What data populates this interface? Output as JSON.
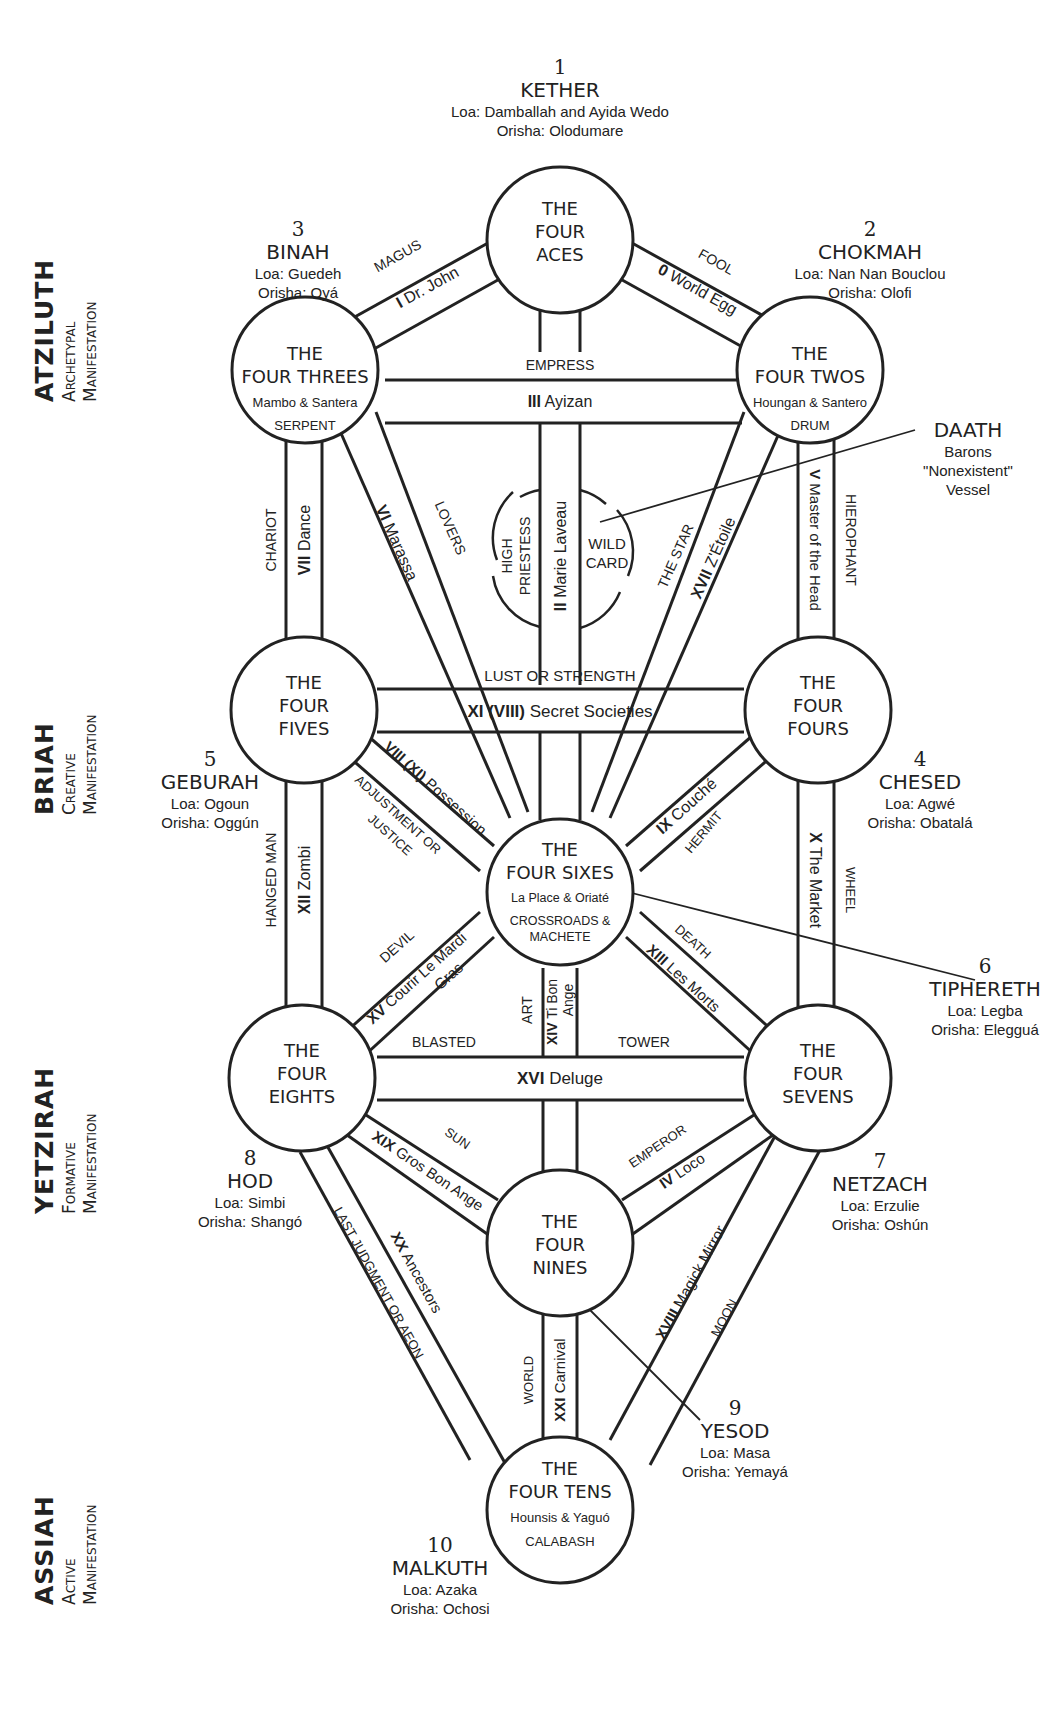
{
  "diagram": {
    "worlds": [
      {
        "name": "ATZILUTH",
        "line1": "Archetypal",
        "line2": "Manifestation"
      },
      {
        "name": "BRIAH",
        "line1": "Creative",
        "line2": "Manifestation"
      },
      {
        "name": "YETZIRAH",
        "line1": "Formative",
        "line2": "Manifestation"
      },
      {
        "name": "ASSIAH",
        "line1": "Active",
        "line2": "Manifestation"
      }
    ],
    "sephiroth": [
      {
        "number": "1",
        "name": "KETHER",
        "loa": "Loa: Damballah and Ayida Wedo",
        "orisha": "Orisha: Olodumare"
      },
      {
        "number": "2",
        "name": "CHOKMAH",
        "loa": "Loa: Nan Nan Bouclou",
        "orisha": "Orisha: Olofi"
      },
      {
        "number": "3",
        "name": "BINAH",
        "loa": "Loa: Guedeh",
        "orisha": "Orisha: Oyá"
      },
      {
        "number": "4",
        "name": "CHESED",
        "loa": "Loa: Agwé",
        "orisha": "Orisha: Obatalá"
      },
      {
        "number": "5",
        "name": "GEBURAH",
        "loa": "Loa: Ogoun",
        "orisha": "Orisha: Oggún"
      },
      {
        "number": "6",
        "name": "TIPHERETH",
        "loa": "Loa: Legba",
        "orisha": "Orisha: Elegguá"
      },
      {
        "number": "7",
        "name": "NETZACH",
        "loa": "Loa: Erzulie",
        "orisha": "Orisha: Oshún"
      },
      {
        "number": "8",
        "name": "HOD",
        "loa": "Loa: Simbi",
        "orisha": "Orisha: Shangó"
      },
      {
        "number": "9",
        "name": "YESOD",
        "loa": "Loa: Masa",
        "orisha": "Orisha: Yemayá"
      },
      {
        "number": "10",
        "name": "MALKUTH",
        "loa": "Loa: Azaka",
        "orisha": "Orisha: Ochosi"
      }
    ],
    "daath": {
      "name": "DAATH",
      "line1": "Barons",
      "line2": "\"Nonexistent\"",
      "line3": "Vessel"
    },
    "circles": {
      "aces": {
        "l1": "THE",
        "l2": "FOUR",
        "l3": "ACES"
      },
      "twos": {
        "l1": "THE",
        "l2": "FOUR TWOS",
        "sub": "Houngan & Santero",
        "symbol": "DRUM"
      },
      "threes": {
        "l1": "THE",
        "l2": "FOUR THREES",
        "sub": "Mambo & Santera",
        "symbol": "SERPENT"
      },
      "fours": {
        "l1": "THE",
        "l2": "FOUR",
        "l3": "FOURS"
      },
      "fives": {
        "l1": "THE",
        "l2": "FOUR",
        "l3": "FIVES"
      },
      "sixes": {
        "l1": "THE",
        "l2": "FOUR SIXES",
        "sub": "La Place & Oriaté",
        "symbol1": "CROSSROADS &",
        "symbol2": "MACHETE"
      },
      "sevens": {
        "l1": "THE",
        "l2": "FOUR",
        "l3": "SEVENS"
      },
      "eights": {
        "l1": "THE",
        "l2": "FOUR",
        "l3": "EIGHTS"
      },
      "nines": {
        "l1": "THE",
        "l2": "FOUR",
        "l3": "NINES"
      },
      "tens": {
        "l1": "THE",
        "l2": "FOUR TENS",
        "sub": "Hounsis & Yaguó",
        "symbol": "CALABASH"
      }
    },
    "wild_card": {
      "line1": "WILD",
      "line2": "CARD"
    },
    "paths": {
      "fool": {
        "trump": "FOOL",
        "num": "0",
        "name": "World Egg"
      },
      "magus": {
        "trump": "MAGUS",
        "num": "I",
        "name": "Dr. John"
      },
      "priestess": {
        "trump": "HIGH PRIESTESS",
        "t1": "HIGH",
        "t2": "PRIESTESS",
        "num": "II",
        "name": "Marie Laveau"
      },
      "empress": {
        "trump": "EMPRESS",
        "num": "III",
        "name": "Ayizan"
      },
      "emperor": {
        "trump": "EMPEROR",
        "num": "IV",
        "name": "Loco"
      },
      "hierophant": {
        "trump": "HIEROPHANT",
        "num": "V",
        "name": "Master of the Head"
      },
      "lovers": {
        "trump": "LOVERS",
        "num": "VI",
        "name": "Marassa"
      },
      "chariot": {
        "trump": "CHARIOT",
        "num": "VII",
        "name": "Dance"
      },
      "adjustment": {
        "trump": "ADJUSTMENT OR",
        "trump2": "JUSTICE",
        "num": "VIII (XI)",
        "name": "Possession"
      },
      "hermit": {
        "trump": "HERMIT",
        "num": "IX",
        "name": "Couché"
      },
      "wheel": {
        "trump": "WHEEL",
        "num": "X",
        "name": "The Market"
      },
      "lust": {
        "trump": "LUST OR STRENGTH",
        "num": "XI (VIII)",
        "name": "Secret Societies"
      },
      "hanged": {
        "trump": "HANGED MAN",
        "num": "XII",
        "name": "Zombi"
      },
      "death": {
        "trump": "DEATH",
        "num": "XIII",
        "name": "Les Morts"
      },
      "art": {
        "trump": "ART",
        "num": "XIV",
        "name": "Ti Bon",
        "name2": "Ange"
      },
      "devil": {
        "trump": "DEVIL",
        "num": "XV",
        "name": "Courir Le Mardi",
        "name2": "Gras"
      },
      "tower": {
        "trump1": "BLASTED",
        "trump2": "TOWER",
        "num": "XVI",
        "name": "Deluge"
      },
      "star": {
        "trump": "THE STAR",
        "num": "XVII",
        "name": "Z'Étoile"
      },
      "moon": {
        "trump": "MOON",
        "num": "XVIII",
        "name": "Magick Mirror"
      },
      "sun": {
        "trump": "SUN",
        "num": "XIX",
        "name": "Gros Bon Ange"
      },
      "aeon": {
        "trump": "LAST JUDGMENT OR AEON",
        "num": "XX",
        "name": "Ancestors"
      },
      "world": {
        "trump": "WORLD",
        "num": "XXI",
        "name": "Carnival"
      }
    }
  }
}
